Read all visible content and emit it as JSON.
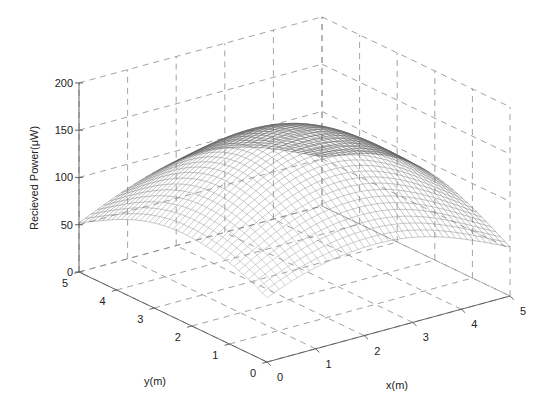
{
  "chart_data": {
    "type": "surface-mesh",
    "title": "",
    "xlabel": "x(m)",
    "ylabel": "y(m)",
    "zlabel": "Recieved Power(μW)",
    "xlim": [
      0,
      5
    ],
    "ylim": [
      0,
      5
    ],
    "zlim": [
      0,
      200
    ],
    "xticks": [
      0,
      1,
      2,
      3,
      4,
      5
    ],
    "yticks": [
      0,
      1,
      2,
      3,
      4,
      5
    ],
    "zticks": [
      0,
      50,
      100,
      150,
      200
    ],
    "grid": true,
    "surface_model": {
      "description": "Dome-shaped received power distribution peaking at room center",
      "peak_value": 160,
      "peak_location": [
        2.5,
        2.5
      ],
      "corner_values": {
        "x0_y0": 68,
        "x5_y0": 50,
        "x0_y5": 52,
        "x5_y5": 52
      },
      "approx_center_value": 160,
      "mesh_resolution": 40
    },
    "sample_points": [
      {
        "x": 0,
        "y": 0,
        "z": 68
      },
      {
        "x": 5,
        "y": 0,
        "z": 50
      },
      {
        "x": 0,
        "y": 5,
        "z": 52
      },
      {
        "x": 2.5,
        "y": 2.5,
        "z": 160
      },
      {
        "x": 2.5,
        "y": 0,
        "z": 92
      },
      {
        "x": 0,
        "y": 2.5,
        "z": 92
      }
    ]
  },
  "labels": {
    "z_axis": "Recieved Power(μW)",
    "x_axis": "x(m)",
    "y_axis": "y(m)"
  },
  "colors": {
    "background": "#ffffff",
    "mesh_dark": "#4a4a4a",
    "mesh_light": "#d8d8d8",
    "grid": "#8a8a8a",
    "text": "#222222"
  }
}
